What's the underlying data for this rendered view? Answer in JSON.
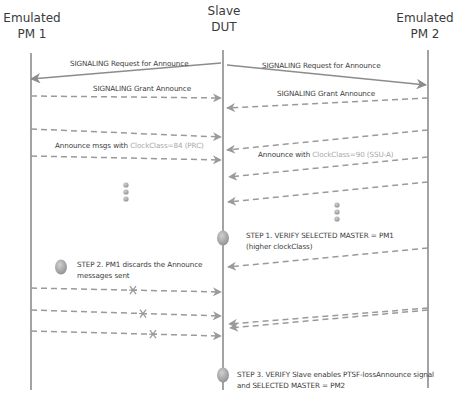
{
  "actors": [
    {
      "id": "pm1",
      "label": "Emulated\nPM 1",
      "x": 31,
      "top": 53,
      "bottom": 390
    },
    {
      "id": "dut",
      "label": "Slave\nDUT",
      "x": 223,
      "top": 50,
      "bottom": 390
    },
    {
      "id": "pm2",
      "label": "Emulated\nPM 2",
      "x": 428,
      "top": 50,
      "bottom": 388
    }
  ],
  "labels": {
    "pm1": "Emulated\nPM 1",
    "dut": "Slave\nDUT",
    "pm2": "Emulated\nPM 2",
    "req_left": "SIGNALING Request for Announce",
    "req_right": "SIGNALING Request for Announce",
    "grant_left": "SIGNALING Grant Announce",
    "grant_right": "SIGNALING Grant Announce",
    "announce_left_prefix": "Announce msgs with ",
    "announce_left_muted": "ClockClass=84 (PRC)",
    "announce_right_prefix": "Announce with ",
    "announce_right_muted": "ClockClass=90 (SSU-A)",
    "step1": "STEP 1. VERIFY SELECTED MASTER = PM1\n(higher clockClass)",
    "step2": "STEP 2. PM1 discards the Announce\nmessages sent",
    "step3": "STEP 3. VERIFY Slave enables PTSF-lossAnnounce signal\nand SELECTED MASTER = PM2"
  },
  "messages": [
    {
      "name": "signaling-request-to-pm1",
      "style": "solid",
      "x1": 221,
      "y1": 63,
      "x2": 31,
      "y2": 79,
      "lost": false
    },
    {
      "name": "signaling-request-to-pm2",
      "style": "solid",
      "x1": 227,
      "y1": 65,
      "x2": 426,
      "y2": 85,
      "lost": false
    },
    {
      "name": "signaling-grant-from-pm1",
      "style": "dashed",
      "x1": 31,
      "y1": 96,
      "x2": 221,
      "y2": 98,
      "lost": false
    },
    {
      "name": "signaling-grant-from-pm2",
      "style": "dashed",
      "x1": 428,
      "y1": 98,
      "x2": 227,
      "y2": 108,
      "lost": false
    },
    {
      "name": "announce-pm1-1",
      "style": "dashed",
      "x1": 31,
      "y1": 129,
      "x2": 221,
      "y2": 137,
      "lost": false
    },
    {
      "name": "announce-pm1-2",
      "style": "dashed",
      "x1": 31,
      "y1": 156,
      "x2": 221,
      "y2": 160,
      "lost": false
    },
    {
      "name": "announce-pm2-1",
      "style": "dashed",
      "x1": 428,
      "y1": 130,
      "x2": 227,
      "y2": 150,
      "lost": false
    },
    {
      "name": "announce-pm2-2",
      "style": "dashed",
      "x1": 428,
      "y1": 157,
      "x2": 229,
      "y2": 177,
      "lost": false
    },
    {
      "name": "announce-pm2-3",
      "style": "dashed",
      "x1": 428,
      "y1": 182,
      "x2": 228,
      "y2": 202,
      "lost": false
    },
    {
      "name": "announce-pm2-4",
      "style": "dashed",
      "x1": 428,
      "y1": 248,
      "x2": 228,
      "y2": 267,
      "lost": false
    },
    {
      "name": "discarded-announce-1",
      "style": "dashed",
      "x1": 31,
      "y1": 288,
      "x2": 221,
      "y2": 292,
      "lost": true,
      "xmark": 133
    },
    {
      "name": "discarded-announce-2",
      "style": "dashed",
      "x1": 31,
      "y1": 310,
      "x2": 221,
      "y2": 316,
      "lost": true,
      "xmark": 143
    },
    {
      "name": "discarded-announce-3",
      "style": "dashed",
      "x1": 31,
      "y1": 331,
      "x2": 221,
      "y2": 336,
      "lost": true,
      "xmark": 153
    },
    {
      "name": "announce-pm2-5",
      "style": "dashed",
      "x1": 428,
      "y1": 308,
      "x2": 229,
      "y2": 324,
      "lost": false
    },
    {
      "name": "announce-pm2-6",
      "style": "dashed",
      "x1": 428,
      "y1": 310,
      "x2": 230,
      "y2": 328,
      "lost": false
    }
  ],
  "ellipsis_dots": [
    {
      "name": "continuation-dots-left",
      "x": 126,
      "ys": [
        185,
        192,
        199
      ]
    },
    {
      "name": "continuation-dots-right",
      "x": 337,
      "ys": [
        205,
        212,
        219
      ]
    }
  ],
  "step_markers": [
    {
      "name": "step1-marker",
      "x": 223,
      "y": 238
    },
    {
      "name": "step2-marker",
      "x": 61,
      "y": 267
    },
    {
      "name": "step3-marker",
      "x": 223,
      "y": 375
    }
  ],
  "colors": {
    "line": "#8c8c8c",
    "dash": "#9a9a9a",
    "marker": "#a9a9a9",
    "text": "#3c3c3c",
    "muted_text": "#a8a8a8"
  }
}
